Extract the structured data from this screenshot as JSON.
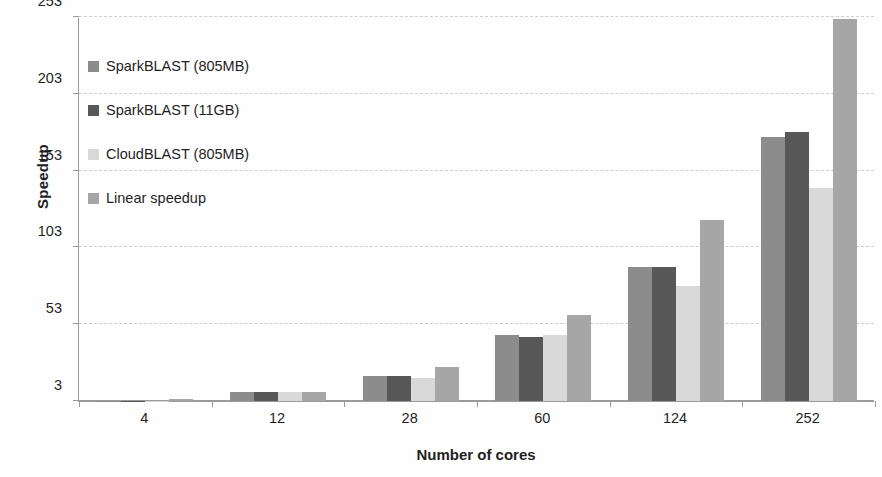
{
  "chart_data": {
    "type": "bar",
    "title": "",
    "xlabel": "Number of cores",
    "ylabel": "Speedup",
    "categories": [
      "4",
      "12",
      "28",
      "60",
      "124",
      "252"
    ],
    "yticks": [
      "3",
      "53",
      "103",
      "153",
      "203",
      "253"
    ],
    "ylim": [
      3,
      253
    ],
    "grid": true,
    "legend_position": "inside-top-left",
    "series": [
      {
        "name": "SparkBLAST (805MB)",
        "color": "#8c8c8c",
        "values": [
          2,
          9,
          19,
          46,
          90,
          175
        ]
      },
      {
        "name": "SparkBLAST (11GB)",
        "color": "#585858",
        "values": [
          2,
          9,
          19,
          45,
          90,
          178
        ]
      },
      {
        "name": "CloudBLAST (805MB)",
        "color": "#d9d9d9",
        "values": [
          2,
          9,
          18,
          46,
          78,
          142
        ]
      },
      {
        "name": "Linear speedup",
        "color": "#a6a6a6",
        "values": [
          4,
          9,
          25,
          59,
          121,
          252
        ]
      }
    ]
  },
  "axis": {
    "y_title": "Speedup",
    "x_title": "Number of cores"
  }
}
